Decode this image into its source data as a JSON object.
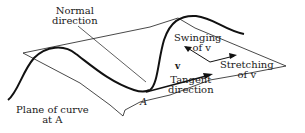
{
  "figure": {
    "labels": {
      "normal_direction": [
        "Normal",
        "direction"
      ],
      "swinging": [
        "Swinging",
        "of v"
      ],
      "stretching": [
        "Stretching",
        "of v"
      ],
      "tangent_direction": [
        "Tangent",
        "direction"
      ],
      "plane_of_curve": [
        "Plane of curve",
        "at A"
      ],
      "point": "A",
      "vector": "v"
    },
    "colors": {
      "ink": "#1a1a1a",
      "background": "#ffffff"
    }
  }
}
